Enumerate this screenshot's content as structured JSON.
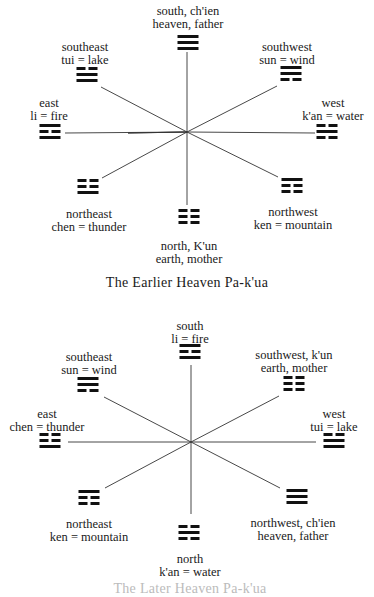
{
  "diagrams": [
    {
      "caption": "The Earlier Heaven Pa-k'ua",
      "positions": {
        "south": {
          "line1": "south, ch'ien",
          "line2": "heaven, father",
          "trigram": [
            "yang",
            "yang",
            "yang"
          ]
        },
        "southeast": {
          "line1": "southeast",
          "line2": "tui  =  lake",
          "trigram": [
            "yin",
            "yang",
            "yang"
          ]
        },
        "southwest": {
          "line1": "southwest",
          "line2": "sun  =  wind",
          "trigram": [
            "yang",
            "yang",
            "yin"
          ]
        },
        "east": {
          "line1": "east",
          "line2": "li  =  fire",
          "trigram": [
            "yang",
            "yin",
            "yang"
          ]
        },
        "west": {
          "line1": "west",
          "line2": "k'an  =  water",
          "trigram": [
            "yin",
            "yang",
            "yin"
          ]
        },
        "northeast": {
          "line1": "northeast",
          "line2": "chen  =  thunder",
          "trigram": [
            "yin",
            "yin",
            "yang"
          ]
        },
        "northwest": {
          "line1": "northwest",
          "line2": "ken  =  mountain",
          "trigram": [
            "yang",
            "yin",
            "yin"
          ]
        },
        "north": {
          "line1": "north, K'un",
          "line2": "earth, mother",
          "trigram": [
            "yin",
            "yin",
            "yin"
          ]
        }
      }
    },
    {
      "caption": "The Later Heaven Pa-k'ua",
      "positions": {
        "south": {
          "line1": "south",
          "line2": "li  =  fire",
          "trigram": [
            "yang",
            "yin",
            "yang"
          ]
        },
        "southeast": {
          "line1": "southeast",
          "line2": "sun  =  wind",
          "trigram": [
            "yang",
            "yang",
            "yin"
          ]
        },
        "southwest": {
          "line1": "southwest, k'un",
          "line2": "earth, mother",
          "trigram": [
            "yin",
            "yin",
            "yin"
          ]
        },
        "east": {
          "line1": "east",
          "line2": "chen  =  thunder",
          "trigram": [
            "yin",
            "yin",
            "yang"
          ]
        },
        "west": {
          "line1": "west",
          "line2": "tui  =  lake",
          "trigram": [
            "yin",
            "yang",
            "yang"
          ]
        },
        "northeast": {
          "line1": "northeast",
          "line2": "ken  =  mountain",
          "trigram": [
            "yang",
            "yin",
            "yin"
          ]
        },
        "northwest": {
          "line1": "northwest, ch'ien",
          "line2": "heaven, father",
          "trigram": [
            "yang",
            "yang",
            "yang"
          ]
        },
        "north": {
          "line1": "north",
          "line2": "k'an  =  water",
          "trigram": [
            "yin",
            "yang",
            "yin"
          ]
        }
      }
    }
  ]
}
